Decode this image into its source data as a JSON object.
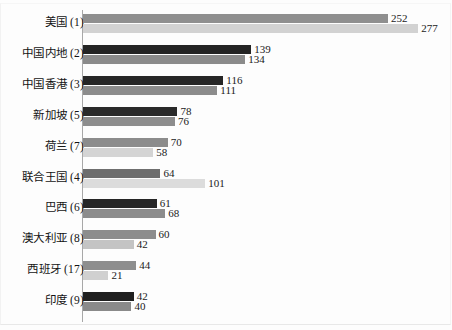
{
  "chart_data": {
    "type": "bar",
    "orientation": "horizontal",
    "title": "",
    "subtitle": "",
    "xlabel": "",
    "ylabel": "",
    "grid": false,
    "legend": null,
    "legend_position": "none",
    "xlim": [
      0,
      290
    ],
    "px_per_unit": 1.21,
    "categories": [
      "美国 (1)",
      "中国内地 (2)",
      "中国香港 (3)",
      "新加坡 (5)",
      "荷兰 (7)",
      "联合王国 (4)",
      "巴西 (6)",
      "澳大利亚 (8)",
      "西班牙 (17)",
      "印度 (9)"
    ],
    "series": [
      {
        "name": "series-a",
        "values": [
          252,
          139,
          116,
          78,
          70,
          64,
          61,
          60,
          44,
          42
        ]
      },
      {
        "name": "series-b",
        "values": [
          277,
          134,
          111,
          76,
          58,
          101,
          68,
          42,
          21,
          40
        ]
      }
    ],
    "bar_colors_a": [
      "#8f8f8f",
      "#242424",
      "#262626",
      "#2a2a2a",
      "#8c8c8c",
      "#6e6e6e",
      "#262626",
      "#8d8d8d",
      "#8e8e8e",
      "#1f1f1f"
    ],
    "bar_colors_b": [
      "#d2d2d2",
      "#8b8b8b",
      "#8c8c8c",
      "#8d8d8d",
      "#d4d4d4",
      "#dcdcdc",
      "#8c8c8c",
      "#c4c4c4",
      "#d0d0d0",
      "#8a8a8a"
    ],
    "value_label_positions_a": [
      "outside",
      "outside",
      "outside",
      "outside",
      "outside",
      "outside",
      "outside",
      "outside",
      "outside",
      "outside"
    ],
    "value_label_positions_b": [
      "outside",
      "outside",
      "outside",
      "outside",
      "inside-right",
      "outside",
      "outside",
      "inside-right",
      "inside-right",
      "outside"
    ],
    "rows": [
      {
        "label": "美国 (1)",
        "a": 252,
        "b": 277,
        "color_a": "#8f8f8f",
        "color_b": "#d2d2d2"
      },
      {
        "label": "中国内地 (2)",
        "a": 139,
        "b": 134,
        "color_a": "#242424",
        "color_b": "#8b8b8b"
      },
      {
        "label": "中国香港 (3)",
        "a": 116,
        "b": 111,
        "color_a": "#262626",
        "color_b": "#8c8c8c"
      },
      {
        "label": "新加坡 (5)",
        "a": 78,
        "b": 76,
        "color_a": "#2a2a2a",
        "color_b": "#8d8d8d"
      },
      {
        "label": "荷兰 (7)",
        "a": 70,
        "b": 58,
        "color_a": "#8c8c8c",
        "color_b": "#d4d4d4"
      },
      {
        "label": "联合王国 (4)",
        "a": 64,
        "b": 101,
        "color_a": "#6e6e6e",
        "color_b": "#dcdcdc"
      },
      {
        "label": "巴西 (6)",
        "a": 61,
        "b": 68,
        "color_a": "#262626",
        "color_b": "#8c8c8c"
      },
      {
        "label": "澳大利亚 (8)",
        "a": 60,
        "b": 42,
        "color_a": "#8d8d8d",
        "color_b": "#c4c4c4"
      },
      {
        "label": "西班牙 (17)",
        "a": 44,
        "b": 21,
        "color_a": "#8e8e8e",
        "color_b": "#d0d0d0"
      },
      {
        "label": "印度 (9)",
        "a": 42,
        "b": 40,
        "color_a": "#1f1f1f",
        "color_b": "#8a8a8a"
      }
    ]
  }
}
